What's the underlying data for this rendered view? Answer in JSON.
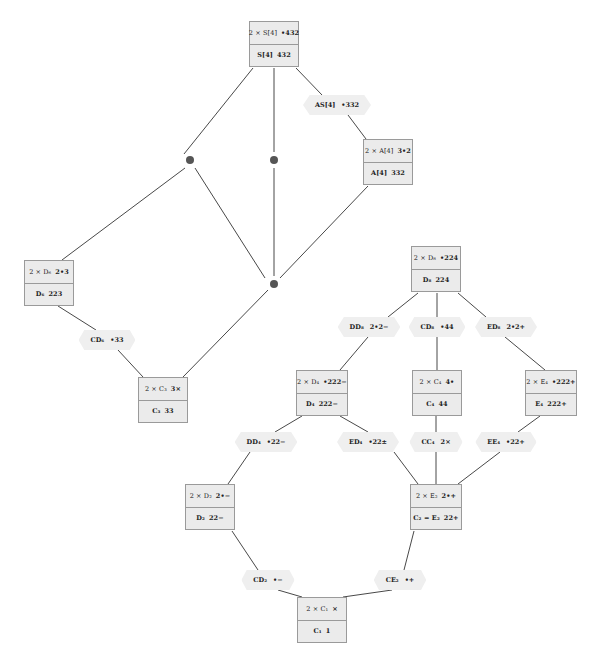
{
  "diagram": {
    "type": "subgroup-lattice",
    "nodes": [
      {
        "id": "S4",
        "top_label": "2 × S[4]",
        "top_symbol": "•432",
        "bottom_label": "S[4]",
        "bottom_symbol": "432"
      },
      {
        "id": "A4",
        "top_label": "2 × A[4]",
        "top_symbol": "3•2",
        "bottom_label": "A[4]",
        "bottom_symbol": "332"
      },
      {
        "id": "D6",
        "top_label": "2 × D₆",
        "top_symbol": "2•3",
        "bottom_label": "D₆",
        "bottom_symbol": "223"
      },
      {
        "id": "C3",
        "top_label": "2 × C₃",
        "top_symbol": "3×",
        "bottom_label": "C₃",
        "bottom_symbol": "33"
      },
      {
        "id": "D8",
        "top_label": "2 × D₈",
        "top_symbol": "•224",
        "bottom_label": "D₈",
        "bottom_symbol": "224"
      },
      {
        "id": "D4",
        "top_label": "2 × D₄",
        "top_symbol": "•222−",
        "bottom_label": "D₄",
        "bottom_symbol": "222−"
      },
      {
        "id": "C4",
        "top_label": "2 × C₄",
        "top_symbol": "4•",
        "bottom_label": "C₄",
        "bottom_symbol": "44"
      },
      {
        "id": "E4",
        "top_label": "2 × E₄",
        "top_symbol": "•222+",
        "bottom_label": "E₄",
        "bottom_symbol": "222+"
      },
      {
        "id": "D2",
        "top_label": "2 × D₂",
        "top_symbol": "2•−",
        "bottom_label": "D₂",
        "bottom_symbol": "22−"
      },
      {
        "id": "E2",
        "top_label": "2 × E₂",
        "top_symbol": "2•+",
        "bottom_label": "C₂ = E₂",
        "bottom_symbol": "22+"
      },
      {
        "id": "C1",
        "top_label": "2 × C₁",
        "top_symbol": "×",
        "bottom_label": "C₁",
        "bottom_symbol": "1"
      }
    ],
    "edge_labels": [
      {
        "id": "AS4",
        "label": "AS[4]",
        "symbol": "•332"
      },
      {
        "id": "CD6",
        "label": "CD₆",
        "symbol": "•33"
      },
      {
        "id": "DD8",
        "label": "DD₈",
        "symbol": "2•2−"
      },
      {
        "id": "CD8",
        "label": "CD₈",
        "symbol": "•44"
      },
      {
        "id": "ED8",
        "label": "ED₈",
        "symbol": "2•2+"
      },
      {
        "id": "DD4",
        "label": "DD₄",
        "symbol": "•22−"
      },
      {
        "id": "ED4",
        "label": "ED₄",
        "symbol": "•22±"
      },
      {
        "id": "CC4",
        "label": "CC₄",
        "symbol": "2×"
      },
      {
        "id": "EE4",
        "label": "EE₄",
        "symbol": "•22+"
      },
      {
        "id": "CD2",
        "label": "CD₂",
        "symbol": "•−"
      },
      {
        "id": "CE2",
        "label": "CE₂",
        "symbol": "•+"
      }
    ],
    "unlabeled_junctions": 3,
    "colors": {
      "node_fill": "#ebebeb",
      "node_border": "#9a9a9a",
      "edge_label_fill": "#efefef",
      "line": "#333333",
      "dot": "#555555"
    }
  }
}
